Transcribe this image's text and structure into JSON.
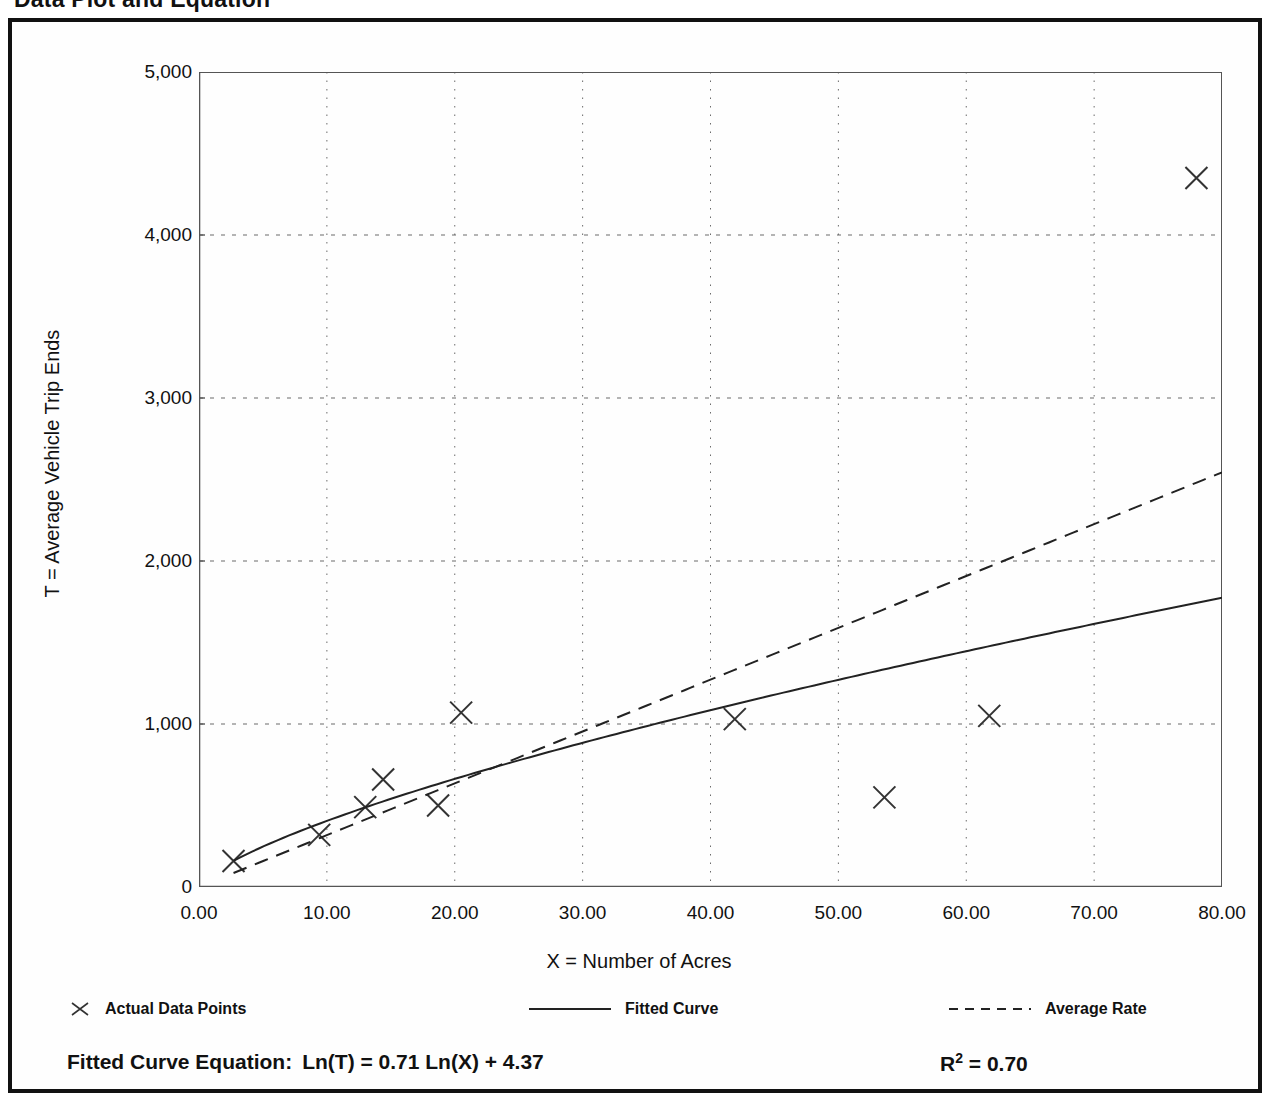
{
  "page": {
    "title": "Data Plot and Equation"
  },
  "chart_data": {
    "type": "scatter",
    "title": "Data Plot and Equation",
    "xlabel": "X = Number of Acres",
    "ylabel": "T = Average Vehicle Trip Ends",
    "xlim": [
      0,
      80
    ],
    "ylim": [
      0,
      5000
    ],
    "xticks": [
      0,
      10,
      20,
      30,
      40,
      50,
      60,
      70,
      80
    ],
    "xtick_labels": [
      "0.00",
      "10.00",
      "20.00",
      "30.00",
      "40.00",
      "50.00",
      "60.00",
      "70.00",
      "80.00"
    ],
    "yticks": [
      0,
      1000,
      2000,
      3000,
      4000,
      5000
    ],
    "ytick_labels": [
      "0",
      "1,000",
      "2,000",
      "3,000",
      "4,000",
      "5,000"
    ],
    "x_minor_tick_step": 5,
    "y_minor_tick_step": 500,
    "grid": "dotted vertical at major x, dashed horizontal at major y",
    "legend_position": "below axes, horizontal",
    "series": [
      {
        "name": "Actual Data Points",
        "type": "scatter",
        "marker": "x",
        "color": "#333333",
        "points": [
          {
            "x": 2.7,
            "y": 160
          },
          {
            "x": 9.4,
            "y": 320
          },
          {
            "x": 13.0,
            "y": 490
          },
          {
            "x": 14.4,
            "y": 660
          },
          {
            "x": 18.7,
            "y": 500
          },
          {
            "x": 20.5,
            "y": 1070
          },
          {
            "x": 41.9,
            "y": 1030
          },
          {
            "x": 53.6,
            "y": 550
          },
          {
            "x": 61.8,
            "y": 1050
          },
          {
            "x": 78.0,
            "y": 4350
          }
        ]
      },
      {
        "name": "Fitted Curve",
        "type": "line",
        "style": "solid",
        "color": "#222222",
        "equation": "Ln(T) = 0.71 Ln(X) + 4.37",
        "slope": 0.71,
        "intercept": 4.37,
        "x_start": 2.7,
        "x_end": 80
      },
      {
        "name": "Average Rate",
        "type": "line",
        "style": "dashed",
        "color": "#222222",
        "rate_per_acre": 31.8,
        "x_start": 2.7,
        "x_end": 80
      }
    ],
    "annotations": {
      "fitted_equation_label": "Fitted Curve Equation:",
      "fitted_equation_text": "Ln(T) = 0.71 Ln(X) + 4.37",
      "r_squared_symbol": "R",
      "r_squared_exponent": "2",
      "r_squared_value": "= 0.70"
    }
  },
  "legend": {
    "entries": [
      {
        "label": "Actual Data Points",
        "icon": "x-marker-icon"
      },
      {
        "label": "Fitted Curve",
        "icon": "solid-line-icon"
      },
      {
        "label": "Average Rate",
        "icon": "dashed-line-icon"
      }
    ]
  }
}
